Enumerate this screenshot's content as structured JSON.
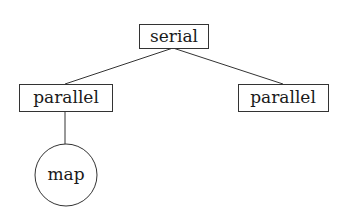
{
  "diagram": {
    "type": "tree",
    "nodes": [
      {
        "id": "serial",
        "label": "serial",
        "shape": "rectangle",
        "x": 139,
        "y": 24,
        "w": 69,
        "h": 24
      },
      {
        "id": "parallel-left",
        "label": "parallel",
        "shape": "rectangle",
        "x": 19,
        "y": 84,
        "w": 93,
        "h": 27
      },
      {
        "id": "parallel-right",
        "label": "parallel",
        "shape": "rectangle",
        "x": 238,
        "y": 84,
        "w": 90,
        "h": 27
      },
      {
        "id": "map",
        "label": "map",
        "shape": "circle",
        "cx": 66,
        "cy": 175,
        "r": 31
      }
    ],
    "edges": [
      {
        "from": "serial",
        "to": "parallel-left"
      },
      {
        "from": "serial",
        "to": "parallel-right"
      },
      {
        "from": "parallel-left",
        "to": "map"
      }
    ],
    "colors": {
      "stroke": "#333333",
      "text": "#1a1a1a",
      "background": "#ffffff"
    }
  }
}
